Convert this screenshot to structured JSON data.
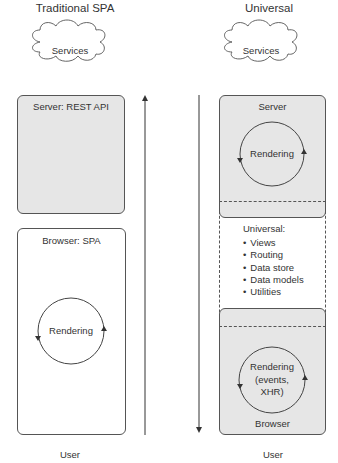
{
  "left": {
    "title": "Traditional SPA",
    "cloud_label": "Services",
    "server_box": {
      "label": "Server: REST API",
      "fill": "#e6e6e6"
    },
    "browser_box": {
      "label": "Browser: SPA",
      "fill": "#ffffff",
      "cycle_label": "Rendering"
    },
    "arrow_direction": "up",
    "footer": "User"
  },
  "right": {
    "title": "Universal",
    "cloud_label": "Services",
    "server_box": {
      "label": "Server",
      "cycle_label": "Rendering",
      "fill": "#e6e6e6"
    },
    "universal_box": {
      "heading": "Universal:",
      "items": [
        "Views",
        "Routing",
        "Data store",
        "Data models",
        "Utilities"
      ]
    },
    "browser_box": {
      "label": "Browser",
      "cycle_label_lines": [
        "Rendering",
        "(events,",
        "XHR)"
      ],
      "fill": "#e6e6e6"
    },
    "arrow_direction": "down",
    "footer": "User"
  }
}
